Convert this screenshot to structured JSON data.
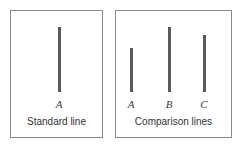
{
  "figure": {
    "background_color": "#ffffff",
    "line_color": "#5a5a5a",
    "border_color": "#8a8a8a",
    "text_color": "#333333",
    "baseline_y": 92
  },
  "panels": {
    "standard": {
      "caption": "Standard line",
      "lines": [
        {
          "label": "A",
          "left": 58,
          "top": 27,
          "bottom": 92,
          "height": 65
        }
      ]
    },
    "comparison": {
      "caption": "Comparison lines",
      "lines": [
        {
          "label": "A",
          "left": 130,
          "top": 48,
          "bottom": 92,
          "height": 44
        },
        {
          "label": "B",
          "left": 168,
          "top": 27,
          "bottom": 92,
          "height": 65
        },
        {
          "label": "C",
          "left": 203,
          "top": 35,
          "bottom": 92,
          "height": 57
        }
      ]
    }
  }
}
